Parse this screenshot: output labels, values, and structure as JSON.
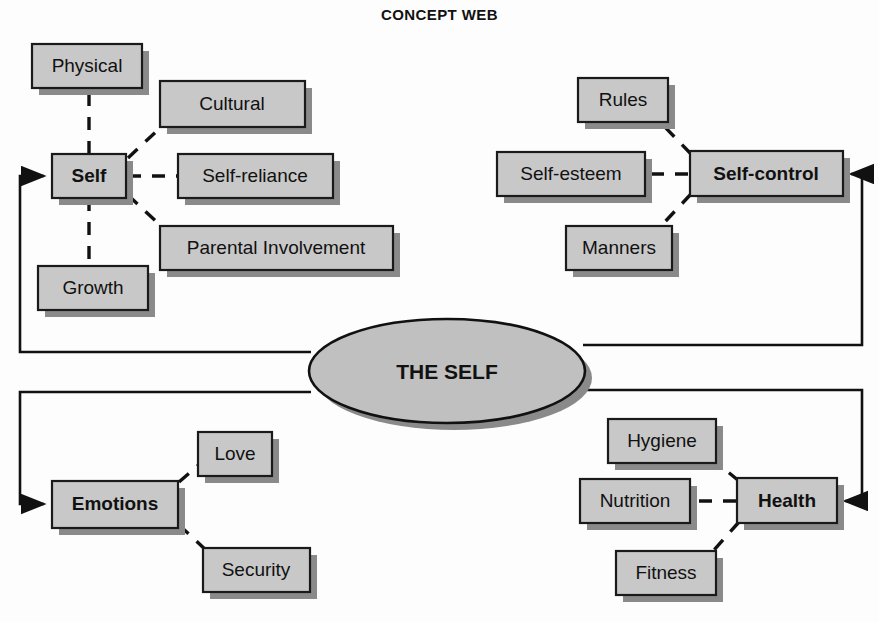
{
  "title": "CONCEPT WEB",
  "center": {
    "label": "THE SELF",
    "shape": "ellipse",
    "cx": 447,
    "cy": 371,
    "rx": 138,
    "ry": 52
  },
  "colors": {
    "node_fill": "#c8c8c8",
    "node_border": "#1a1a1a",
    "shadow": "#8a8a8a",
    "ellipse_fill": "#c0c0c0",
    "text": "#111111",
    "background": "#fdfdfd"
  },
  "clusters": [
    {
      "id": "self",
      "hub": "Self",
      "children": [
        "Physical",
        "Cultural",
        "Self-reliance",
        "Parental Involvement",
        "Growth"
      ]
    },
    {
      "id": "self-control",
      "hub": "Self-control",
      "children": [
        "Rules",
        "Self-esteem",
        "Manners"
      ]
    },
    {
      "id": "emotions",
      "hub": "Emotions",
      "children": [
        "Love",
        "Security"
      ]
    },
    {
      "id": "health",
      "hub": "Health",
      "children": [
        "Hygiene",
        "Nutrition",
        "Fitness"
      ]
    }
  ],
  "nodes": {
    "physical": {
      "label": "Physical",
      "x": 32,
      "y": 44,
      "w": 110,
      "h": 44,
      "bold": false
    },
    "cultural": {
      "label": "Cultural",
      "x": 160,
      "y": 81,
      "w": 145,
      "h": 46,
      "bold": false
    },
    "self": {
      "label": "Self",
      "x": 52,
      "y": 154,
      "w": 74,
      "h": 44,
      "bold": true
    },
    "self_reliance": {
      "label": "Self-reliance",
      "x": 178,
      "y": 154,
      "w": 155,
      "h": 44,
      "bold": false
    },
    "parental": {
      "label": "Parental Involvement",
      "x": 160,
      "y": 226,
      "w": 233,
      "h": 44,
      "bold": false
    },
    "growth": {
      "label": "Growth",
      "x": 38,
      "y": 266,
      "w": 110,
      "h": 44,
      "bold": false
    },
    "rules": {
      "label": "Rules",
      "x": 578,
      "y": 78,
      "w": 90,
      "h": 44,
      "bold": false
    },
    "self_esteem": {
      "label": "Self-esteem",
      "x": 497,
      "y": 152,
      "w": 148,
      "h": 44,
      "bold": false
    },
    "self_control": {
      "label": "Self-control",
      "x": 690,
      "y": 151,
      "w": 153,
      "h": 45,
      "bold": true
    },
    "manners": {
      "label": "Manners",
      "x": 566,
      "y": 226,
      "w": 106,
      "h": 44,
      "bold": false
    },
    "love": {
      "label": "Love",
      "x": 198,
      "y": 432,
      "w": 74,
      "h": 44,
      "bold": false
    },
    "emotions": {
      "label": "Emotions",
      "x": 52,
      "y": 481,
      "w": 126,
      "h": 47,
      "bold": true
    },
    "security": {
      "label": "Security",
      "x": 203,
      "y": 548,
      "w": 107,
      "h": 44,
      "bold": false
    },
    "hygiene": {
      "label": "Hygiene",
      "x": 608,
      "y": 419,
      "w": 108,
      "h": 44,
      "bold": false
    },
    "nutrition": {
      "label": "Nutrition",
      "x": 580,
      "y": 479,
      "w": 110,
      "h": 44,
      "bold": false
    },
    "health": {
      "label": "Health",
      "x": 737,
      "y": 478,
      "w": 100,
      "h": 45,
      "bold": true
    },
    "fitness": {
      "label": "Fitness",
      "x": 616,
      "y": 551,
      "w": 100,
      "h": 44,
      "bold": false
    }
  },
  "connectors": {
    "style_inner": "dashed",
    "style_outer": "solid-with-arrow",
    "arrow_targets": [
      "Self",
      "Self-control",
      "Emotions",
      "Health"
    ]
  }
}
